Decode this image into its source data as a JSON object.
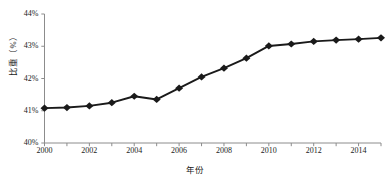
{
  "chart_data": {
    "type": "line",
    "title": "",
    "xlabel": "年份",
    "ylabel": "比重（%）",
    "x": [
      2000,
      2001,
      2002,
      2003,
      2004,
      2005,
      2006,
      2007,
      2008,
      2009,
      2010,
      2011,
      2012,
      2013,
      2014,
      2015
    ],
    "values": [
      41.08,
      41.1,
      41.15,
      41.25,
      41.45,
      41.35,
      41.7,
      42.05,
      42.32,
      42.63,
      43.01,
      43.07,
      43.15,
      43.19,
      43.22,
      43.26
    ],
    "series": [
      {
        "name": "比重（%）",
        "values": [
          41.08,
          41.1,
          41.15,
          41.25,
          41.45,
          41.35,
          41.7,
          42.05,
          42.32,
          42.63,
          43.01,
          43.07,
          43.15,
          43.19,
          43.22,
          43.26
        ]
      }
    ],
    "xlim": [
      2000,
      2015
    ],
    "ylim": [
      40,
      44
    ],
    "ytick_labels": [
      "40%",
      "41%",
      "42%",
      "43%",
      "44%"
    ],
    "ytick_values": [
      40,
      41,
      42,
      43,
      44
    ],
    "xtick_labels": [
      "2000",
      "2002",
      "2004",
      "2006",
      "2008",
      "2010",
      "2012",
      "2014"
    ],
    "xtick_values": [
      2000,
      2002,
      2004,
      2006,
      2008,
      2010,
      2012,
      2014
    ],
    "grid": false,
    "legend": "none",
    "marker": "diamond",
    "line_color": "#1a1a1a",
    "marker_color": "#1a1a1a",
    "axis_color": "#8c8c8c",
    "background_color": "#ffffff"
  },
  "axis_titles": {
    "y": "比重（%）",
    "x": "年份"
  }
}
